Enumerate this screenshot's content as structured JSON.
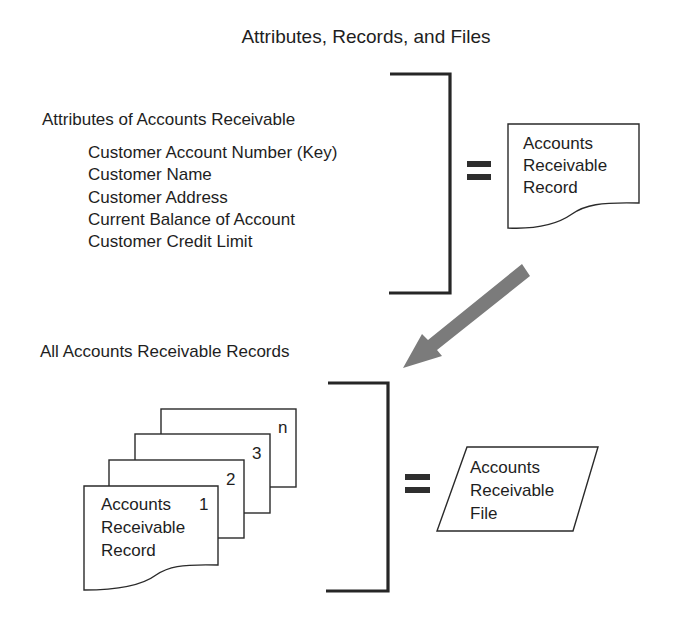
{
  "diagram": {
    "title": "Attributes, Records, and Files",
    "attributes_section": {
      "heading": "Attributes of Accounts Receivable",
      "items": [
        "Customer Account Number (Key)",
        "Customer Name",
        "Customer Address",
        "Current Balance of Account",
        "Customer Credit Limit"
      ]
    },
    "record_document": {
      "lines": [
        "Accounts",
        "Receivable",
        "Record"
      ]
    },
    "equals_symbol": "=",
    "records_section": {
      "heading": "All Accounts Receivable Records",
      "stack_labels": [
        "1",
        "2",
        "3",
        "n"
      ],
      "front_record_lines": [
        "Accounts",
        "Receivable",
        "Record"
      ]
    },
    "file_shape": {
      "lines": [
        "Accounts",
        "Receivable",
        "File"
      ]
    },
    "colors": {
      "line": "#262626",
      "arrow": "#7b7b7b",
      "text": "#1e1e1e",
      "background": "#ffffff"
    }
  }
}
